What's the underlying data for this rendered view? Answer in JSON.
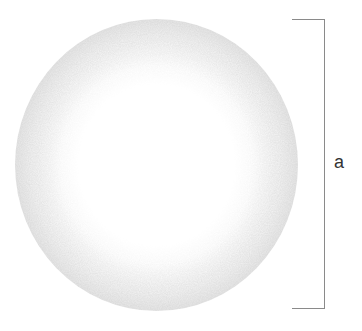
{
  "figure": {
    "dimension": {
      "label": "a",
      "meaning": "diameter"
    }
  },
  "colors": {
    "sphere_edge": "#b8b8b8",
    "sphere_center": "#ffffff",
    "bracket": "#8a8a8a",
    "label": "#333333"
  }
}
